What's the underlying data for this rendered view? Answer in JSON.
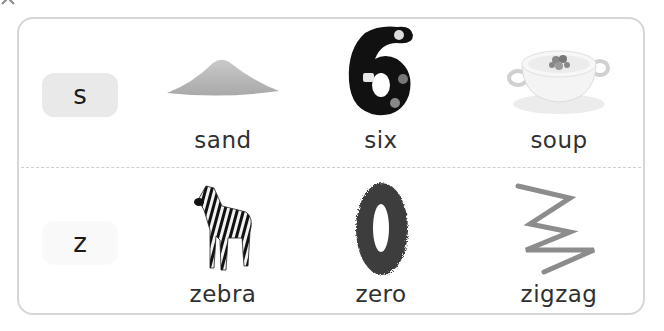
{
  "rows": [
    {
      "letter": "s",
      "badge_color": "#e9e9e9",
      "items": [
        {
          "word": "sand",
          "icon": "sand-pile-icon"
        },
        {
          "word": "six",
          "icon": "number-six-icon"
        },
        {
          "word": "soup",
          "icon": "soup-bowl-icon"
        }
      ]
    },
    {
      "letter": "z",
      "badge_color": "#f9f9f9",
      "items": [
        {
          "word": "zebra",
          "icon": "zebra-icon"
        },
        {
          "word": "zero",
          "icon": "number-zero-icon"
        },
        {
          "word": "zigzag",
          "icon": "zigzag-line-icon"
        }
      ]
    }
  ],
  "colors": {
    "card_border": "#d6d6d6",
    "divider": "#cfcfcf",
    "text": "#303030"
  }
}
